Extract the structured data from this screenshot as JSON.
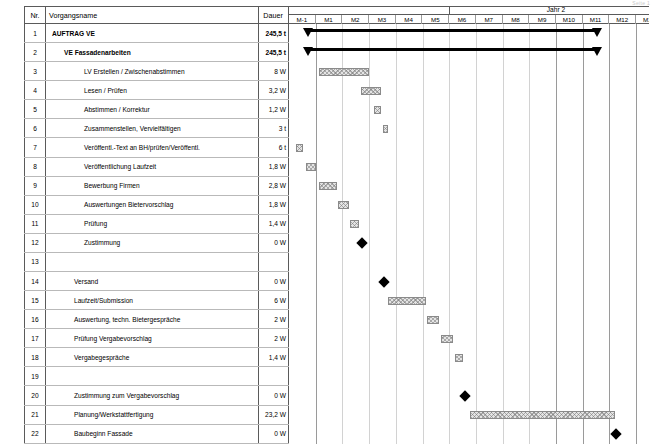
{
  "meta": {
    "corner_text": "Seite 1"
  },
  "table": {
    "headers": {
      "nr": "Nr.",
      "name": "Vorgangsname",
      "duration": "Dauer"
    },
    "rows": [
      {
        "nr": "1",
        "name": "AUFTRAG VE",
        "duration": "245,5 t",
        "level": 1
      },
      {
        "nr": "2",
        "name": "VE Fassadenarbeiten",
        "duration": "245,5 t",
        "level": 2
      },
      {
        "nr": "3",
        "name": "LV Erstellen / Zwischenabstimmen",
        "duration": "8 W",
        "level": 3
      },
      {
        "nr": "4",
        "name": "Lesen / Prüfen",
        "duration": "3,2 W",
        "level": 3
      },
      {
        "nr": "5",
        "name": "Abstimmen / Korrektur",
        "duration": "1,2 W",
        "level": 3
      },
      {
        "nr": "6",
        "name": "Zusammenstellen, Vervielfältigen",
        "duration": "3 t",
        "level": 3
      },
      {
        "nr": "7",
        "name": "Veröffentl.-Text an BH/prüfen/Veröffentl.",
        "duration": "6 t",
        "level": 3
      },
      {
        "nr": "8",
        "name": "Veröffentlichung Laufzeit",
        "duration": "1,8 W",
        "level": 3
      },
      {
        "nr": "9",
        "name": "Bewerbung Firmen",
        "duration": "2,8 W",
        "level": 3
      },
      {
        "nr": "10",
        "name": "Auswertungen Bietervorschlag",
        "duration": "1,8 W",
        "level": 3
      },
      {
        "nr": "11",
        "name": "Prüfung",
        "duration": "1,4 W",
        "level": 3
      },
      {
        "nr": "12",
        "name": "Zustimmung",
        "duration": "0 W",
        "level": 3
      },
      {
        "nr": "13",
        "name": "",
        "duration": "",
        "level": 3
      },
      {
        "nr": "14",
        "name": "Versand",
        "duration": "0 W",
        "level": 4
      },
      {
        "nr": "15",
        "name": "Laufzeit/Submission",
        "duration": "6 W",
        "level": 4
      },
      {
        "nr": "16",
        "name": "Auswertung, techn. Bietergespräche",
        "duration": "2 W",
        "level": 4
      },
      {
        "nr": "17",
        "name": "Prüfung Vergabevorschlag",
        "duration": "2 W",
        "level": 4
      },
      {
        "nr": "18",
        "name": "Vergabegespräche",
        "duration": "1,4 W",
        "level": 4
      },
      {
        "nr": "19",
        "name": "",
        "duration": "",
        "level": 4
      },
      {
        "nr": "20",
        "name": "Zustimmung zum Vergabevorschlag",
        "duration": "0 W",
        "level": 4
      },
      {
        "nr": "21",
        "name": "Planung/Werkstattfertigung",
        "duration": "23,2 W",
        "level": 4
      },
      {
        "nr": "22",
        "name": "Baubeginn Fassade",
        "duration": "0 W",
        "level": 4
      }
    ]
  },
  "timeline": {
    "year_label": "Jahr 2",
    "year_span_start": 6,
    "year_span_end": 14,
    "months": [
      "M-1",
      "M1",
      "M2",
      "M3",
      "M4",
      "M5",
      "M6",
      "M7",
      "M8",
      "M9",
      "M10",
      "M11",
      "M12",
      "M13"
    ],
    "col_width": 26.7
  },
  "chart_data": {
    "type": "bar",
    "xlabel": "Monate",
    "ylabel": "Vorgänge",
    "grid": true,
    "legend": "none",
    "x_axis": {
      "ticks": [
        "M-1",
        "M1",
        "M2",
        "M3",
        "M4",
        "M5",
        "M6",
        "M7",
        "M8",
        "M9",
        "M10",
        "M11",
        "M12",
        "M13"
      ],
      "unit": "month"
    },
    "tasks": [
      {
        "nr": "1",
        "name": "AUFTRAG VE",
        "duration": "245,5 t",
        "shape": "summary",
        "start_month": 0.62,
        "end_month": 11.6
      },
      {
        "nr": "2",
        "name": "VE Fassadenarbeiten",
        "duration": "245,5 t",
        "shape": "summary",
        "start_month": 0.62,
        "end_month": 11.6
      },
      {
        "nr": "3",
        "name": "LV Erstellen / Zwischenabstimmen",
        "duration": "8 W",
        "shape": "bar",
        "start_month": 1.12,
        "end_month": 2.98
      },
      {
        "nr": "4",
        "name": "Lesen / Prüfen",
        "duration": "3,2 W",
        "shape": "bar",
        "start_month": 2.7,
        "end_month": 3.45
      },
      {
        "nr": "5",
        "name": "Abstimmen / Korrektur",
        "duration": "1,2 W",
        "shape": "bar",
        "start_month": 3.18,
        "end_month": 3.45
      },
      {
        "nr": "6",
        "name": "Zusammenstellen, Vervielfältigen",
        "duration": "3 t",
        "shape": "bar",
        "start_month": 3.52,
        "end_month": 3.7
      },
      {
        "nr": "7",
        "name": "Veröffentl.-Text an BH/prüfen/Veröffentl.",
        "duration": "6 t",
        "shape": "bar",
        "start_month": 0.28,
        "end_month": 0.52
      },
      {
        "nr": "8",
        "name": "Veröffentlichung Laufzeit",
        "duration": "1,8 W",
        "shape": "bar",
        "start_month": 0.62,
        "end_month": 1.02
      },
      {
        "nr": "9",
        "name": "Bewerbung Firmen",
        "duration": "2,8 W",
        "shape": "bar",
        "start_month": 1.12,
        "end_month": 1.78
      },
      {
        "nr": "10",
        "name": "Auswertungen Bietervorschlag",
        "duration": "1,8 W",
        "shape": "bar",
        "start_month": 1.85,
        "end_month": 2.25
      },
      {
        "nr": "11",
        "name": "Prüfung",
        "duration": "1,4 W",
        "shape": "bar",
        "start_month": 2.3,
        "end_month": 2.62
      },
      {
        "nr": "12",
        "name": "Zustimmung",
        "duration": "0 W",
        "shape": "milestone",
        "start_month": 2.75,
        "end_month": 2.75
      },
      {
        "nr": "13",
        "name": "",
        "duration": "",
        "shape": "none",
        "start_month": null,
        "end_month": null
      },
      {
        "nr": "14",
        "name": "Versand",
        "duration": "0 W",
        "shape": "milestone",
        "start_month": 3.55,
        "end_month": 3.55
      },
      {
        "nr": "15",
        "name": "Laufzeit/Submission",
        "duration": "6 W",
        "shape": "bar",
        "start_month": 3.72,
        "end_month": 5.12
      },
      {
        "nr": "16",
        "name": "Auswertung, techn. Bietergespräche",
        "duration": "2 W",
        "shape": "bar",
        "start_month": 5.18,
        "end_month": 5.62
      },
      {
        "nr": "17",
        "name": "Prüfung Vergabevorschlag",
        "duration": "2 W",
        "shape": "bar",
        "start_month": 5.7,
        "end_month": 6.15
      },
      {
        "nr": "18",
        "name": "Vergabegespräche",
        "duration": "1,4 W",
        "shape": "bar",
        "start_month": 6.22,
        "end_month": 6.52
      },
      {
        "nr": "19",
        "name": "",
        "duration": "",
        "shape": "none",
        "start_month": null,
        "end_month": null
      },
      {
        "nr": "20",
        "name": "Zustimmung zum Vergabevorschlag",
        "duration": "0 W",
        "shape": "milestone",
        "start_month": 6.6,
        "end_month": 6.6
      },
      {
        "nr": "21",
        "name": "Planung/Werkstattfertigung",
        "duration": "23,2 W",
        "shape": "bar",
        "start_month": 6.78,
        "end_month": 12.2
      },
      {
        "nr": "22",
        "name": "Baubeginn Fassade",
        "duration": "0 W",
        "shape": "milestone",
        "start_month": 12.25,
        "end_month": 12.25
      }
    ]
  }
}
